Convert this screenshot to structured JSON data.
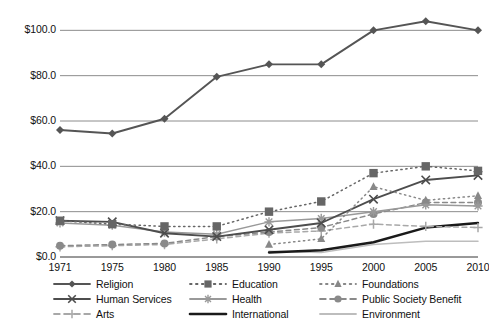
{
  "chart_data": {
    "type": "line",
    "title": "",
    "subtitle": "",
    "xlabel": "",
    "ylabel": "",
    "x": [
      1971,
      1975,
      1980,
      1985,
      1990,
      1995,
      2000,
      2005,
      2010
    ],
    "xtick_labels": [
      "1971",
      "1975",
      "1980",
      "1985",
      "1990",
      "1995",
      "2000",
      "2005",
      "2010"
    ],
    "ytick_labels": [
      "$0.0",
      "$20.0",
      "$40.0",
      "$60.0",
      "$80.0",
      "$100.0"
    ],
    "ytick_values": [
      0,
      20,
      40,
      60,
      80,
      100
    ],
    "ylim": [
      0,
      105
    ],
    "grid": "horizontal",
    "legend_position": "bottom",
    "legend_columns": 3,
    "series": [
      {
        "name": "Religion",
        "marker": "diamond",
        "line_style": "solid",
        "color": "#555555",
        "values": [
          56.0,
          54.5,
          61.0,
          79.5,
          85.0,
          85.0,
          100.0,
          104.0,
          100.0
        ]
      },
      {
        "name": "Education",
        "marker": "square",
        "line_style": "dotted",
        "color": "#666666",
        "values": [
          16.0,
          14.5,
          13.5,
          13.5,
          20.0,
          24.5,
          37.0,
          40.0,
          38.0
        ]
      },
      {
        "name": "Foundations",
        "marker": "triangle",
        "line_style": "dotted",
        "color": "#888888",
        "values": [
          null,
          null,
          null,
          null,
          5.5,
          8.0,
          31.0,
          25.0,
          27.0
        ]
      },
      {
        "name": "Human Services",
        "marker": "x",
        "line_style": "solid",
        "color": "#4d4d4d",
        "values": [
          16.0,
          15.5,
          10.5,
          9.0,
          12.0,
          15.0,
          25.5,
          34.0,
          36.0
        ]
      },
      {
        "name": "Health",
        "marker": "asterisk",
        "line_style": "solid",
        "color": "#999999",
        "values": [
          15.0,
          14.0,
          11.0,
          10.0,
          15.5,
          17.0,
          20.0,
          23.0,
          22.5
        ]
      },
      {
        "name": "Public Society Benefit",
        "marker": "circle",
        "line_style": "dashed",
        "color": "#8a8a8a",
        "values": [
          5.0,
          5.5,
          6.0,
          9.0,
          11.0,
          13.0,
          19.0,
          24.0,
          24.0
        ]
      },
      {
        "name": "Arts",
        "marker": "plus",
        "line_style": "dashed",
        "color": "#a8a8a8",
        "values": [
          4.5,
          5.0,
          5.5,
          8.0,
          10.5,
          11.5,
          14.5,
          13.5,
          13.0
        ]
      },
      {
        "name": "International",
        "marker": "none",
        "line_style": "solid-thick",
        "color": "#1a1a1a",
        "values": [
          null,
          null,
          null,
          null,
          2.0,
          3.0,
          6.5,
          13.0,
          15.0
        ]
      },
      {
        "name": "Environment",
        "marker": "none",
        "line_style": "solid",
        "color": "#bdbdbd",
        "values": [
          null,
          null,
          null,
          null,
          2.5,
          2.0,
          5.5,
          7.0,
          7.0
        ]
      }
    ]
  },
  "legend": {
    "columns": [
      {
        "items": [
          {
            "label": "Religion",
            "key": "religion"
          },
          {
            "label": "Human Services",
            "key": "human-services"
          },
          {
            "label": "Arts",
            "key": "arts"
          }
        ]
      },
      {
        "items": [
          {
            "label": "Education",
            "key": "education"
          },
          {
            "label": "Health",
            "key": "health"
          },
          {
            "label": "International",
            "key": "international"
          }
        ]
      },
      {
        "items": [
          {
            "label": "Foundations",
            "key": "foundations"
          },
          {
            "label": "Public Society Benefit",
            "key": "public-society-benefit"
          },
          {
            "label": "Environment",
            "key": "environment"
          }
        ]
      }
    ]
  },
  "colors": {
    "grid": "#8c8c8c",
    "axis": "#6e6e6e",
    "background": "#ffffff",
    "text": "#111111"
  }
}
